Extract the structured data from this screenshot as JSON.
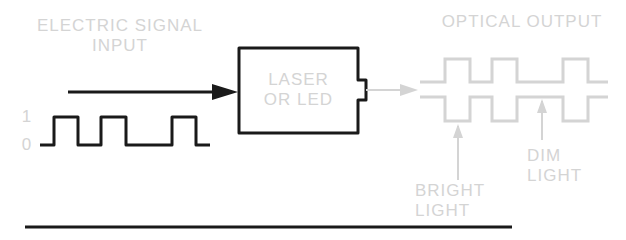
{
  "labels": {
    "input_title_line1": "ELECTRIC SIGNAL",
    "input_title_line2": "INPUT",
    "box_line1": "LASER",
    "box_line2": "OR LED",
    "output_title": "OPTICAL OUTPUT",
    "level_high": "1",
    "level_low": "0",
    "bright_line1": "BRIGHT",
    "bright_line2": "LIGHT",
    "dim_line1": "DIM",
    "dim_line2": "LIGHT"
  },
  "colors": {
    "ink": "#1a1a1a",
    "faded": "#d4d4d4"
  },
  "signal": {
    "bits": [
      0,
      1,
      0,
      1,
      0,
      0,
      1,
      0
    ]
  }
}
